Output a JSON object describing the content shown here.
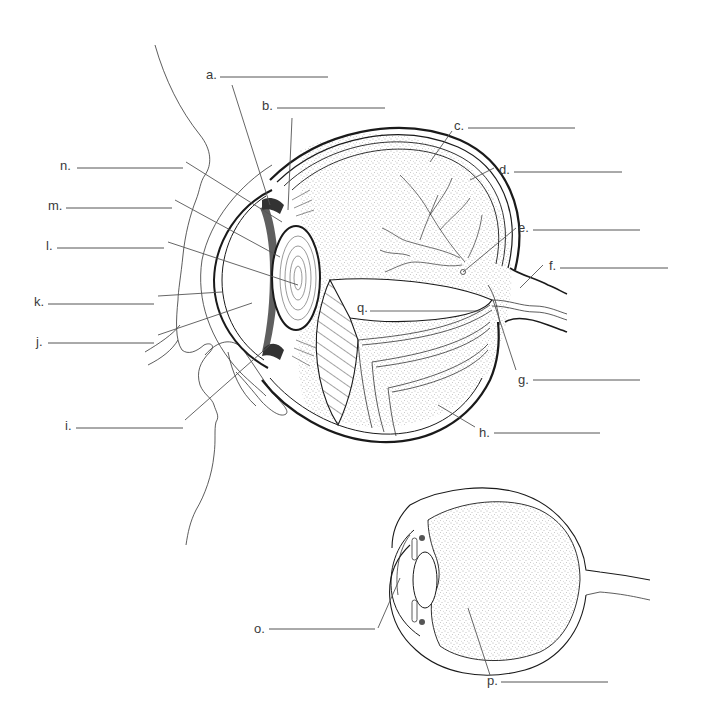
{
  "colors": {
    "ink": "#1a1a1a",
    "leader": "#555555",
    "label": "#3a3a3a",
    "background": "#ffffff"
  },
  "main_diagram": {
    "description": "Sagittal cutaway of the human eye with face profile",
    "labels": [
      {
        "id": "a",
        "text": "a.",
        "answer": ""
      },
      {
        "id": "b",
        "text": "b.",
        "answer": ""
      },
      {
        "id": "c",
        "text": "c.",
        "answer": ""
      },
      {
        "id": "d",
        "text": "d.",
        "answer": ""
      },
      {
        "id": "e",
        "text": "e.",
        "answer": ""
      },
      {
        "id": "f",
        "text": "f.",
        "answer": ""
      },
      {
        "id": "g",
        "text": "g.",
        "answer": ""
      },
      {
        "id": "h",
        "text": "h.",
        "answer": ""
      },
      {
        "id": "i",
        "text": "i.",
        "answer": ""
      },
      {
        "id": "j",
        "text": "j.",
        "answer": ""
      },
      {
        "id": "k",
        "text": "k.",
        "answer": ""
      },
      {
        "id": "l",
        "text": "l.",
        "answer": ""
      },
      {
        "id": "m",
        "text": "m.",
        "answer": ""
      },
      {
        "id": "n",
        "text": "n.",
        "answer": ""
      },
      {
        "id": "q",
        "text": "q.",
        "answer": ""
      }
    ]
  },
  "small_diagram": {
    "description": "Simplified cross-section of the eye",
    "labels": [
      {
        "id": "o",
        "text": "o.",
        "answer": ""
      },
      {
        "id": "p",
        "text": "p.",
        "answer": ""
      }
    ]
  }
}
